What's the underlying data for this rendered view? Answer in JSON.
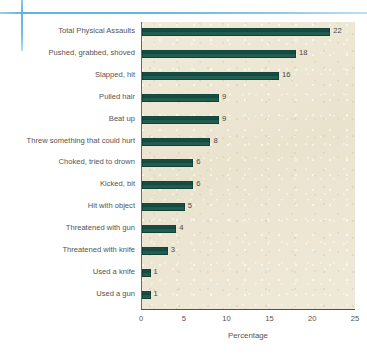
{
  "chart_data": {
    "type": "bar",
    "orientation": "horizontal",
    "title": "",
    "xlabel": "Percentage",
    "ylabel": "",
    "xlim": [
      0,
      25
    ],
    "xticks": [
      0,
      5,
      10,
      15,
      20,
      25
    ],
    "grid": false,
    "legend": null,
    "bar_color": "#1a5247",
    "plot_background": "#ece6d2",
    "categories": [
      "Total Physical Assaults",
      "Pushed, grabbed, shoved",
      "Slapped, hit",
      "Pulled hair",
      "Beat up",
      "Threw something that could hurt",
      "Choked, tried to drown",
      "Kicked, bit",
      "Hit with object",
      "Threatened with gun",
      "Threatened with knife",
      "Used a knife",
      "Used a gun"
    ],
    "values": [
      22,
      18,
      16,
      9,
      9,
      8,
      6,
      6,
      5,
      4,
      3,
      1,
      1
    ],
    "value_labels": [
      "22",
      "18",
      "16",
      "9",
      "9",
      "8",
      "6",
      "6",
      "5",
      "4",
      "3",
      "1",
      "1"
    ]
  },
  "decoration": {
    "accent_color": "#5fb4dd"
  }
}
